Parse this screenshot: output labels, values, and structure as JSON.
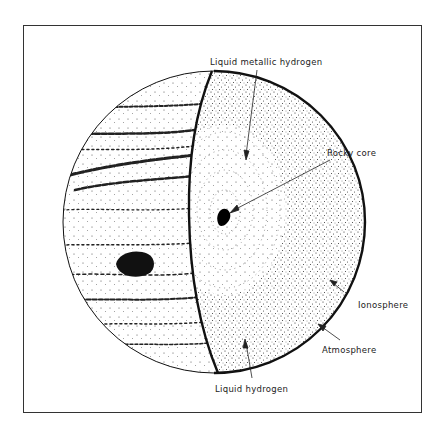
{
  "diagram": {
    "labels": {
      "liquid_metallic_hydrogen": "Liquid metallic hydrogen",
      "rocky_core": "Rocky core",
      "ionosphere": "Ionosphere",
      "atmosphere": "Atmosphere",
      "liquid_hydrogen": "Liquid hydrogen"
    },
    "colors": {
      "ink": "#111111",
      "background": "#ffffff",
      "frame": "#333333"
    }
  }
}
